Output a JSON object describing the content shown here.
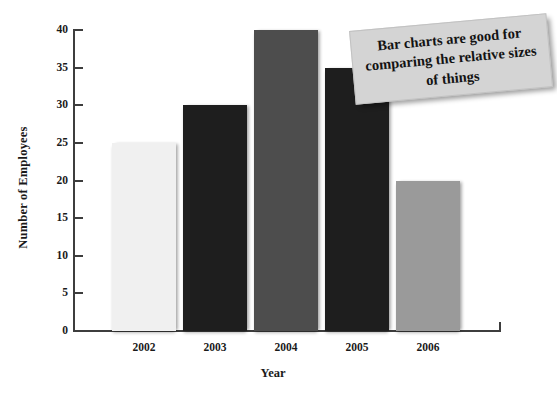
{
  "figure": {
    "title_cropped": "Number of Employees at Zigzar Motors 2002-2006",
    "callout_text": "Bar charts are good for comparing the relative sizes of things"
  },
  "chart_data": {
    "type": "bar",
    "title": "Number of Employees at Zigzar Motors 2002-2006",
    "xlabel": "Year",
    "ylabel": "Number of Employees",
    "categories": [
      "2002",
      "2003",
      "2004",
      "2005",
      "2006"
    ],
    "values": [
      25,
      30,
      40,
      35,
      20
    ],
    "bar_colors": [
      "#f0f0f0",
      "#1e1e1e",
      "#4d4d4d",
      "#1e1e1e",
      "#9a9a9a"
    ],
    "ylim": [
      0,
      40
    ],
    "ytick_labels": [
      "0",
      "5",
      "10",
      "15",
      "20",
      "25",
      "30",
      "35",
      "40"
    ],
    "ytick_values": [
      0,
      5,
      10,
      15,
      20,
      25,
      30,
      35,
      40
    ],
    "grid": false,
    "legend": false,
    "annotations": [
      {
        "name": "callout-note",
        "text": "Bar charts are good for comparing the relative sizes of things",
        "position": "top-right"
      }
    ]
  },
  "axis_colors": {
    "axis_line": "#3d3d3d",
    "text": "#1a1a1a",
    "callout_bg": "#d4d4d4"
  }
}
